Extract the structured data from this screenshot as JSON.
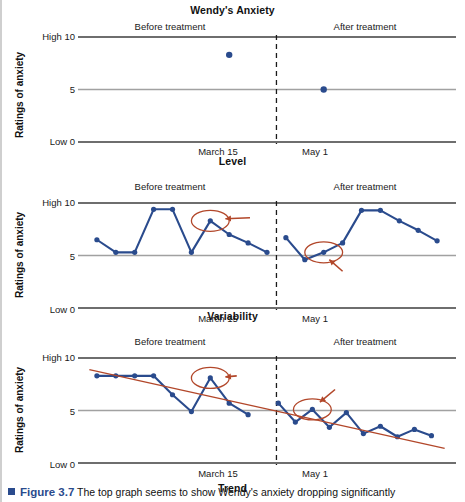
{
  "figure": {
    "title": "Wendy's Anxiety",
    "caption_label": "Figure 3.7",
    "caption_text": "The top graph seems to show Wendy's anxiety dropping significantly",
    "colors": {
      "series": "#2a4b8d",
      "annotation": "#b2472a",
      "trend": "#b2472a",
      "gridline": "#6e6e6e",
      "phase_line": "#1a1a1a"
    }
  },
  "axes": {
    "ylabel": "Ratings of anxiety",
    "yticks": [
      "High 10",
      "5",
      "Low 0"
    ],
    "ytick_values": [
      10,
      5,
      0
    ],
    "xticks": [
      "March 15",
      "May 1"
    ],
    "phase_before": "Before treatment",
    "phase_after": "After treatment"
  },
  "chart_data": [
    {
      "type": "scatter",
      "title": "Wendy's Anxiety",
      "panel_label": "Level",
      "xlabel": "",
      "ylabel": "Ratings of anxiety",
      "ylim": [
        0,
        10
      ],
      "yticks": [
        0,
        5,
        10
      ],
      "ytick_labels": [
        "Low 0",
        "5",
        "High 10"
      ],
      "grid": true,
      "phase_change_x": 10.5,
      "phase_labels": [
        "Before treatment",
        "After treatment"
      ],
      "xtick_positions": [
        8.0,
        13.0
      ],
      "xtick_labels": [
        "March 15",
        "May 1"
      ],
      "series": [
        {
          "name": "Before treatment mean",
          "points": [
            {
              "x": 8.0,
              "y": 8.3
            }
          ]
        },
        {
          "name": "After treatment mean",
          "points": [
            {
              "x": 13.0,
              "y": 5.0
            }
          ]
        }
      ],
      "annotations": []
    },
    {
      "type": "line",
      "title": "",
      "panel_label": "Variability",
      "xlabel": "",
      "ylabel": "Ratings of anxiety",
      "ylim": [
        0,
        10
      ],
      "yticks": [
        0,
        5,
        10
      ],
      "ytick_labels": [
        "Low 0",
        "5",
        "High 10"
      ],
      "grid": true,
      "phase_change_x": 10.5,
      "phase_labels": [
        "Before treatment",
        "After treatment"
      ],
      "xtick_positions": [
        8.0,
        13.0
      ],
      "xtick_labels": [
        "March 15",
        "May 1"
      ],
      "series": [
        {
          "name": "Before treatment",
          "x": [
            1,
            2,
            3,
            4,
            5,
            6,
            7,
            8,
            9,
            10
          ],
          "values": [
            6.5,
            5.3,
            5.3,
            9.4,
            9.4,
            5.3,
            8.3,
            7.0,
            6.2,
            5.3
          ]
        },
        {
          "name": "After treatment",
          "x": [
            11,
            12,
            13,
            14,
            15,
            16,
            17,
            18,
            19
          ],
          "values": [
            6.7,
            4.6,
            5.3,
            6.2,
            9.3,
            9.3,
            8.3,
            7.4,
            6.4
          ]
        }
      ],
      "annotations": [
        {
          "kind": "circle",
          "x": 7,
          "y": 8.3,
          "r": 1.0
        },
        {
          "kind": "arrow",
          "from_x": 9.1,
          "from_y": 8.6,
          "to_x": 7.8,
          "to_y": 8.5
        },
        {
          "kind": "circle",
          "x": 13,
          "y": 5.3,
          "r": 1.0
        },
        {
          "kind": "arrow",
          "from_x": 14.0,
          "from_y": 3.5,
          "to_x": 13.3,
          "to_y": 4.6
        }
      ]
    },
    {
      "type": "line",
      "title": "",
      "panel_label": "Trend",
      "xlabel": "",
      "ylabel": "Ratings of anxiety",
      "ylim": [
        0,
        10
      ],
      "yticks": [
        0,
        5,
        10
      ],
      "ytick_labels": [
        "Low 0",
        "5",
        "High 10"
      ],
      "grid": true,
      "phase_change_x": 10.5,
      "phase_labels": [
        "Before treatment",
        "After treatment"
      ],
      "xtick_positions": [
        8.0,
        13.0
      ],
      "xtick_labels": [
        "March 15",
        "May 1"
      ],
      "series": [
        {
          "name": "Before treatment",
          "x": [
            1,
            2,
            3,
            4,
            5,
            6,
            7,
            8,
            9
          ],
          "values": [
            8.3,
            8.3,
            8.3,
            8.3,
            6.5,
            4.9,
            8.1,
            5.7,
            4.6
          ]
        },
        {
          "name": "After treatment",
          "x": [
            10.6,
            11.5,
            12.4,
            13.3,
            14.2,
            15.1,
            16.0,
            16.9,
            17.8,
            18.7
          ],
          "values": [
            5.7,
            3.9,
            5.1,
            3.4,
            4.8,
            2.8,
            3.5,
            2.5,
            3.2,
            2.6
          ]
        },
        {
          "name": "Trend line",
          "x": [
            0.6,
            19.4
          ],
          "values": [
            8.9,
            1.4
          ],
          "style": "trend"
        }
      ],
      "annotations": [
        {
          "kind": "circle",
          "x": 7,
          "y": 8.1,
          "r": 1.0
        },
        {
          "kind": "arrow",
          "from_x": 8.4,
          "from_y": 8.3,
          "to_x": 7.8,
          "to_y": 8.2
        },
        {
          "kind": "circle",
          "x": 12.4,
          "y": 5.1,
          "r": 1.0
        },
        {
          "kind": "arrow",
          "from_x": 13.6,
          "from_y": 7.0,
          "to_x": 12.8,
          "to_y": 5.8
        }
      ]
    }
  ]
}
